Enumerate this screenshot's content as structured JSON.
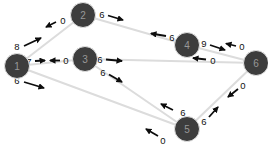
{
  "diagram": {
    "type": "directed-weighted-graph",
    "colors": {
      "background": "#ffffff",
      "node_fill": "#3d3d3d",
      "node_ring": "#e2e2e2",
      "node_label": "#989898",
      "edge_line": "#dcdcdc",
      "arrow": "#0d0d0d",
      "weight_text": "#111111"
    },
    "nodes": [
      {
        "id": "1",
        "label": "1",
        "x": 17,
        "y": 66,
        "r": 12.5
      },
      {
        "id": "2",
        "label": "2",
        "x": 83,
        "y": 15,
        "r": 12.5
      },
      {
        "id": "3",
        "label": "3",
        "x": 85,
        "y": 59,
        "r": 12.5
      },
      {
        "id": "4",
        "label": "4",
        "x": 187,
        "y": 45,
        "r": 12.5
      },
      {
        "id": "5",
        "label": "5",
        "x": 187,
        "y": 129,
        "r": 12.5
      },
      {
        "id": "6",
        "label": "6",
        "x": 256,
        "y": 63,
        "r": 12.5
      }
    ],
    "edges": [
      {
        "from": "1",
        "to": "2"
      },
      {
        "from": "2",
        "to": "4"
      },
      {
        "from": "1",
        "to": "3"
      },
      {
        "from": "3",
        "to": "6"
      },
      {
        "from": "4",
        "to": "6"
      },
      {
        "from": "1",
        "to": "5"
      },
      {
        "from": "3",
        "to": "5"
      },
      {
        "from": "5",
        "to": "6"
      }
    ],
    "directed_weights": [
      {
        "from": "1",
        "to": "2",
        "value": "8",
        "text_x": 17,
        "text_y": 46,
        "ax1": 24,
        "ay1": 46,
        "ax2": 41,
        "ay2": 38
      },
      {
        "from": "2",
        "to": "1",
        "value": "0",
        "text_x": 63,
        "text_y": 20,
        "ax1": 56,
        "ay1": 22,
        "ax2": 46,
        "ay2": 27
      },
      {
        "from": "1",
        "to": "3",
        "value": "7",
        "text_x": 29,
        "text_y": 61,
        "ax1": 35,
        "ay1": 61,
        "ax2": 45,
        "ay2": 60.5
      },
      {
        "from": "3",
        "to": "1",
        "value": "0",
        "text_x": 66,
        "text_y": 60.5,
        "ax1": 60,
        "ay1": 60.5,
        "ax2": 50,
        "ay2": 60.5
      },
      {
        "from": "2",
        "to": "4",
        "value": "6",
        "text_x": 102,
        "text_y": 14,
        "ax1": 108,
        "ay1": 15.5,
        "ax2": 123,
        "ay2": 20
      },
      {
        "from": "4",
        "to": "2",
        "value": "6",
        "text_x": 172,
        "text_y": 37,
        "ax1": 166,
        "ay1": 36,
        "ax2": 151,
        "ay2": 33.5
      },
      {
        "from": "3",
        "to": "6",
        "value": "6",
        "text_x": 100,
        "text_y": 59,
        "ax1": 106,
        "ay1": 59.5,
        "ax2": 122,
        "ay2": 61
      },
      {
        "from": "6",
        "to": "3",
        "value": "0",
        "text_x": 213,
        "text_y": 60.5,
        "ax1": 206,
        "ay1": 59.5,
        "ax2": 193,
        "ay2": 58
      },
      {
        "from": "4",
        "to": "6",
        "value": "9",
        "text_x": 204,
        "text_y": 43,
        "ax1": 210,
        "ay1": 45,
        "ax2": 225,
        "ay2": 50
      },
      {
        "from": "6",
        "to": "4",
        "value": "0",
        "text_x": 242,
        "text_y": 46.5,
        "ax1": 236,
        "ay1": 46,
        "ax2": 226,
        "ay2": 43.5
      },
      {
        "from": "1",
        "to": "5",
        "value": "6",
        "text_x": 17,
        "text_y": 80,
        "ax1": 24,
        "ay1": 82,
        "ax2": 44,
        "ay2": 88
      },
      {
        "from": "5",
        "to": "1",
        "value": "0",
        "text_x": 163,
        "text_y": 140,
        "ax1": 158,
        "ay1": 136,
        "ax2": 146,
        "ay2": 129
      },
      {
        "from": "3",
        "to": "5",
        "value": "6",
        "text_x": 103,
        "text_y": 72,
        "ax1": 109,
        "ay1": 74.5,
        "ax2": 122,
        "ay2": 82
      },
      {
        "from": "5",
        "to": "3",
        "value": "6",
        "text_x": 183,
        "text_y": 112,
        "ax1": 173,
        "ay1": 110,
        "ax2": 161,
        "ay2": 104
      },
      {
        "from": "5",
        "to": "6",
        "value": "6",
        "text_x": 204,
        "text_y": 121,
        "ax1": 209,
        "ay1": 117,
        "ax2": 218,
        "ay2": 107
      },
      {
        "from": "6",
        "to": "5",
        "value": "0",
        "text_x": 243,
        "text_y": 85,
        "ax1": 238,
        "ay1": 89,
        "ax2": 228,
        "ay2": 97
      }
    ]
  }
}
